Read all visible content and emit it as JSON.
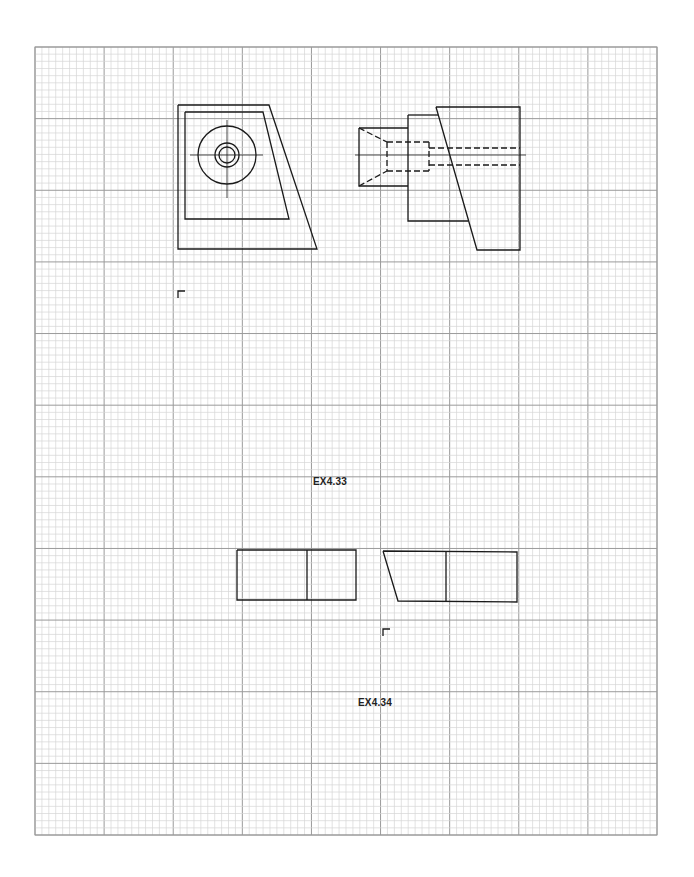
{
  "sheet": {
    "grid": {
      "left": 35,
      "top": 47,
      "right": 657,
      "bottom": 835,
      "major_cols": 9,
      "major_rows": 11,
      "minor_per_major": 10,
      "minor_color": "#d6d6d6",
      "major_color": "#9a9a9a",
      "border_color": "#9a9a9a"
    },
    "line_color": "#1a1a1a"
  },
  "exercises": [
    {
      "id": "EX4.33",
      "label": "EX4.33",
      "label_pos": [
        313,
        476
      ],
      "corner_mark": [
        178,
        291
      ],
      "views": {
        "front": {
          "outer": [
            [
              178,
              105
            ],
            [
              269,
              105
            ],
            [
              317,
              249
            ],
            [
              178,
              249
            ]
          ],
          "inner": [
            [
              185,
              112
            ],
            [
              263,
              112
            ],
            [
              289,
              219
            ],
            [
              185,
              219
            ]
          ],
          "circles": {
            "cx": 227,
            "cy": 155,
            "radii": [
              29,
              12,
              8
            ]
          },
          "centerlines": [
            [
              [
                190,
                155
              ],
              [
                263,
                155
              ]
            ],
            [
              [
                227,
                120
              ],
              [
                227,
                198
              ]
            ]
          ]
        },
        "side": {
          "solid": [
            [
              [
                436,
                107
              ],
              [
                520,
                107
              ],
              [
                520,
                250
              ],
              [
                477,
                250
              ],
              [
                436,
                107
              ]
            ],
            [
              [
                408,
                115
              ],
              [
                438,
                115
              ]
            ],
            [
              [
                408,
                115
              ],
              [
                408,
                221
              ],
              [
                468,
                221
              ]
            ],
            [
              [
                359,
                128
              ],
              [
                408,
                128
              ]
            ],
            [
              [
                359,
                128
              ],
              [
                359,
                186
              ],
              [
                408,
                186
              ]
            ]
          ],
          "hidden": [
            [
              [
                359,
                128
              ],
              [
                387,
                142
              ]
            ],
            [
              [
                359,
                186
              ],
              [
                387,
                171
              ]
            ],
            [
              [
                387,
                142
              ],
              [
                429,
                142
              ]
            ],
            [
              [
                387,
                171
              ],
              [
                429,
                171
              ]
            ],
            [
              [
                387,
                142
              ],
              [
                387,
                171
              ]
            ],
            [
              [
                429,
                142
              ],
              [
                429,
                171
              ]
            ],
            [
              [
                429,
                148
              ],
              [
                520,
                148
              ]
            ],
            [
              [
                429,
                165
              ],
              [
                520,
                165
              ]
            ]
          ],
          "centerline": [
            [
              355,
              155
            ],
            [
              526,
              155
            ]
          ]
        }
      }
    },
    {
      "id": "EX4.34",
      "label": "EX4.34",
      "label_pos": [
        358,
        697
      ],
      "corner_mark": [
        383,
        629
      ],
      "views": {
        "left": {
          "solid": [
            [
              [
                237,
                550
              ],
              [
                356,
                550
              ],
              [
                356,
                600
              ],
              [
                237,
                600
              ],
              [
                237,
                550
              ]
            ],
            [
              [
                307,
                550
              ],
              [
                307,
                600
              ]
            ]
          ]
        },
        "right": {
          "solid": [
            [
              [
                383,
                551
              ],
              [
                517,
                552
              ],
              [
                517,
                602
              ],
              [
                398,
                601
              ],
              [
                383,
                551
              ]
            ],
            [
              [
                446,
                551
              ],
              [
                446,
                601
              ]
            ]
          ]
        }
      }
    }
  ]
}
